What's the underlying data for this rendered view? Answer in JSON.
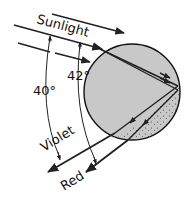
{
  "diagram": {
    "labels": {
      "sunlight": "Sunlight",
      "angle_violet": "40°",
      "angle_red": "42°",
      "violet": "Violet",
      "red": "Red"
    },
    "colors": {
      "drop_fill": "#c8c8c8",
      "drop_stroke": "#111111",
      "ray": "#222222",
      "background": "#ffffff"
    }
  }
}
